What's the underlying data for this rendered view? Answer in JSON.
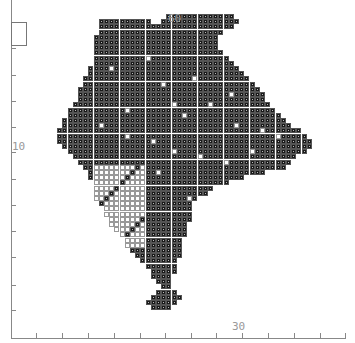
{
  "map": {
    "type": "grid distribution map",
    "cell_size_px": 5.2,
    "origin": {
      "x": 44,
      "y": 14
    },
    "labels": [
      {
        "text": "60",
        "x": 168,
        "y": 14
      },
      {
        "text": "10",
        "x": 12,
        "y": 149
      },
      {
        "text": "30",
        "x": 232,
        "y": 322
      }
    ],
    "x_axis": {
      "y": 338,
      "x0": 11,
      "x1": 346,
      "ticks": [
        36,
        62,
        88,
        114,
        140,
        165,
        191,
        216,
        242,
        268,
        294,
        320,
        345
      ]
    },
    "y_axis": {
      "x": 11,
      "y0": 0,
      "y1": 338,
      "ticks": [
        48,
        75,
        101,
        127,
        152,
        179,
        205,
        231,
        257,
        285,
        310
      ]
    },
    "colors": {
      "dot": "#1a1a1a",
      "grid": "#999999",
      "axis": "#888888",
      "label": "#999999"
    },
    "rows": [
      {
        "y": 0,
        "x0": 32,
        "x1": 44
      },
      {
        "y": 1,
        "x0": 19,
        "x1": 28
      },
      {
        "y": 1,
        "x0": 31,
        "x1": 45
      },
      {
        "y": 2,
        "x0": 19,
        "x1": 44
      },
      {
        "y": 3,
        "x0": 19,
        "x1": 42
      },
      {
        "y": 4,
        "x0": 18,
        "x1": 41
      },
      {
        "y": 5,
        "x0": 18,
        "x1": 41
      },
      {
        "y": 6,
        "x0": 18,
        "x1": 41
      },
      {
        "y": 7,
        "x0": 18,
        "x1": 42
      },
      {
        "y": 8,
        "x0": 18,
        "x1": 43
      },
      {
        "y": 9,
        "x0": 18,
        "x1": 44
      },
      {
        "y": 10,
        "x0": 17,
        "x1": 45
      },
      {
        "y": 11,
        "x0": 17,
        "x1": 46
      },
      {
        "y": 12,
        "x0": 16,
        "x1": 47
      },
      {
        "y": 13,
        "x0": 16,
        "x1": 48
      },
      {
        "y": 14,
        "x0": 15,
        "x1": 49
      },
      {
        "y": 15,
        "x0": 15,
        "x1": 50
      },
      {
        "y": 16,
        "x0": 15,
        "x1": 50
      },
      {
        "y": 17,
        "x0": 14,
        "x1": 51
      },
      {
        "y": 18,
        "x0": 13,
        "x1": 52
      },
      {
        "y": 19,
        "x0": 13,
        "x1": 53
      },
      {
        "y": 20,
        "x0": 12,
        "x1": 54
      },
      {
        "y": 21,
        "x0": 12,
        "x1": 55
      },
      {
        "y": 22,
        "x0": 11,
        "x1": 57
      },
      {
        "y": 23,
        "x0": 11,
        "x1": 58
      },
      {
        "y": 24,
        "x0": 11,
        "x1": 59
      },
      {
        "y": 25,
        "x0": 12,
        "x1": 59
      },
      {
        "y": 26,
        "x0": 13,
        "x1": 58
      },
      {
        "y": 27,
        "x0": 14,
        "x1": 56
      },
      {
        "y": 28,
        "x0": 15,
        "x1": 55
      },
      {
        "y": 29,
        "x0": 16,
        "x1": 54
      },
      {
        "y": 30,
        "x0": 17,
        "x1": 50
      },
      {
        "y": 31,
        "x0": 17,
        "x1": 46
      },
      {
        "y": 32,
        "x0": 18,
        "x1": 43
      },
      {
        "y": 33,
        "x0": 18,
        "x1": 40
      },
      {
        "y": 34,
        "x0": 18,
        "x1": 39
      },
      {
        "y": 35,
        "x0": 18,
        "x1": 37
      },
      {
        "y": 36,
        "x0": 19,
        "x1": 36
      },
      {
        "y": 37,
        "x0": 20,
        "x1": 36
      },
      {
        "y": 38,
        "x0": 20,
        "x1": 36
      },
      {
        "y": 39,
        "x0": 21,
        "x1": 36
      },
      {
        "y": 40,
        "x0": 21,
        "x1": 35
      },
      {
        "y": 41,
        "x0": 22,
        "x1": 35
      },
      {
        "y": 42,
        "x0": 23,
        "x1": 35
      },
      {
        "y": 43,
        "x0": 24,
        "x1": 34
      },
      {
        "y": 44,
        "x0": 24,
        "x1": 34
      },
      {
        "y": 45,
        "x0": 25,
        "x1": 34
      },
      {
        "y": 46,
        "x0": 26,
        "x1": 34
      },
      {
        "y": 47,
        "x0": 27,
        "x1": 33
      },
      {
        "y": 48,
        "x0": 28,
        "x1": 33
      },
      {
        "y": 49,
        "x0": 29,
        "x1": 33
      },
      {
        "y": 50,
        "x0": 29,
        "x1": 32
      },
      {
        "y": 51,
        "x0": 30,
        "x1": 32
      },
      {
        "y": 52,
        "x0": 31,
        "x1": 32
      },
      {
        "y": 53,
        "x0": 30,
        "x1": 33
      },
      {
        "y": 54,
        "x0": 29,
        "x1": 34
      },
      {
        "y": 55,
        "x0": 28,
        "x1": 33
      },
      {
        "y": 56,
        "x0": 29,
        "x1": 32
      }
    ],
    "empty_region": {
      "x0": 18,
      "x1": 27,
      "y0": 29,
      "y1": 44
    },
    "empty_cells": [
      [
        21,
        10
      ],
      [
        28,
        8
      ],
      [
        31,
        13
      ],
      [
        37,
        12
      ],
      [
        40,
        17
      ],
      [
        44,
        15
      ],
      [
        45,
        21
      ],
      [
        35,
        19
      ],
      [
        24,
        23
      ],
      [
        29,
        24
      ],
      [
        33,
        26
      ],
      [
        38,
        27
      ],
      [
        43,
        28
      ],
      [
        48,
        26
      ],
      [
        50,
        22
      ],
      [
        53,
        23
      ],
      [
        30,
        30
      ],
      [
        27,
        33
      ],
      [
        36,
        35
      ],
      [
        40,
        37
      ],
      [
        19,
        21
      ],
      [
        24,
        18
      ],
      [
        33,
        17
      ]
    ]
  }
}
